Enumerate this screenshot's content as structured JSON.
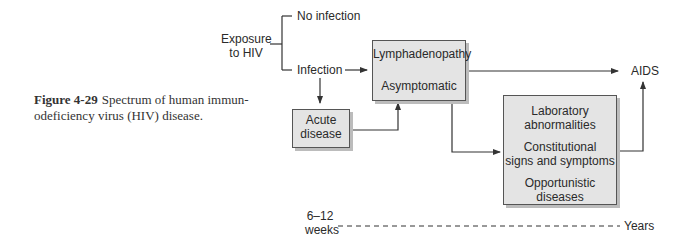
{
  "caption": {
    "figure_number": "Figure 4-29",
    "text": "Spectrum of human immun-odeficiency virus (HIV) disease."
  },
  "nodes": {
    "exposure_line1": "Exposure",
    "exposure_line2": "to HIV",
    "no_infection": "No infection",
    "infection": "Infection",
    "acute_line1": "Acute",
    "acute_line2": "disease",
    "lymph": "Lymphadenopathy",
    "asymptomatic": "Asymptomatic",
    "aids": "AIDS",
    "lab_line1": "Laboratory",
    "lab_line2": "abnormalities",
    "const_line1": "Constitutional",
    "const_line2": "signs and symptoms",
    "opp_line1": "Opportunistic",
    "opp_line2": "diseases"
  },
  "timeline": {
    "start_line1": "6–12",
    "start_line2": "weeks",
    "end": "Years"
  }
}
